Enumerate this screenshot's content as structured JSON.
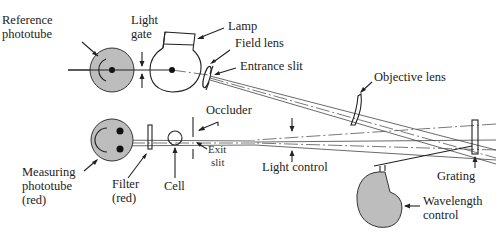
{
  "diagram": {
    "type": "optical schematic",
    "fill_color": "#bdbdbd",
    "line_color": "#222222",
    "labels": {
      "reference_phototube": [
        "Reference",
        "phototube"
      ],
      "light_gate": [
        "Light",
        "gate"
      ],
      "lamp": "Lamp",
      "field_lens": "Field lens",
      "entrance_slit": "Entrance slit",
      "objective_lens": "Objective lens",
      "occluder": "Occluder",
      "exit_slit": [
        "Exit",
        "slit"
      ],
      "light_control": "Light control",
      "grating": "Grating",
      "measuring_phototube": [
        "Measuring",
        "phototube",
        "(red)"
      ],
      "filter": [
        "Filter",
        "(red)"
      ],
      "cell": "Cell",
      "wavelength_control": [
        "Wavelength",
        "control"
      ]
    }
  }
}
